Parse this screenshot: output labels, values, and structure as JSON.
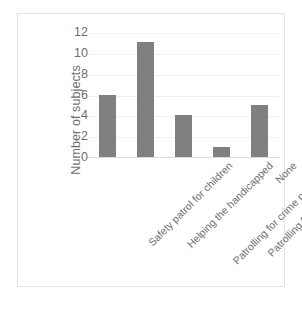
{
  "chart_data": {
    "type": "bar",
    "title": "",
    "xlabel": "",
    "ylabel": "Number of subjects",
    "ylim": [
      0,
      12
    ],
    "ytick_step": 2,
    "yticks": [
      12,
      10,
      8,
      6,
      4,
      2,
      0
    ],
    "grid": true,
    "legend": "none",
    "bar_color": "#808080",
    "gridline_color": "#efefef",
    "text_color": "#6f6f6f",
    "frame_color": "#e3e3e3",
    "categories": [
      "Safety patrol for children",
      "Helping the handicapped",
      "Patrolling for crime prevention",
      "Patrolling for fire prevention",
      "None"
    ],
    "values": [
      6,
      11,
      4,
      1,
      5
    ]
  },
  "caption": {
    "text": ""
  }
}
